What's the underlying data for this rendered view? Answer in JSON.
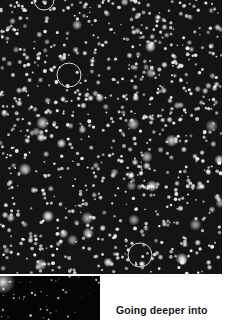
{
  "figure": {
    "main_image": {
      "description": "Dense globular star cluster field, grayscale",
      "marker_circles": [
        {
          "cx": 44,
          "cy": 0,
          "r": 10
        },
        {
          "cx": 69,
          "cy": 75,
          "r": 12
        },
        {
          "cx": 140,
          "cy": 255,
          "r": 12
        }
      ]
    },
    "inset_image": {
      "description": "Sparse deep-field star image with bright glow at top-left"
    },
    "caption": "Going deeper into"
  },
  "colors": {
    "background": "#ffffff",
    "field": "#141414",
    "inset": "#050505",
    "text": "#1a1a1a"
  }
}
